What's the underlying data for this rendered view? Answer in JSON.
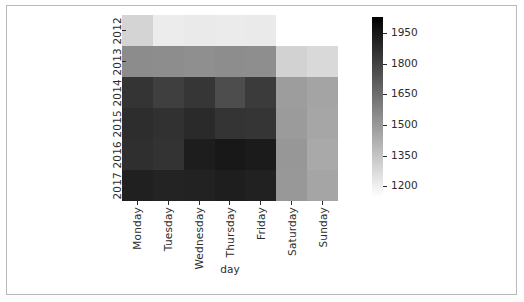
{
  "chart_data": {
    "type": "heatmap",
    "title": "",
    "xlabel": "day",
    "ylabel": "",
    "grid": false,
    "colormap": "gray_reversed",
    "x_categories": [
      "Monday",
      "Tuesday",
      "Wednesday",
      "Thursday",
      "Friday",
      "Saturday",
      "Sunday"
    ],
    "y_categories": [
      "2012",
      "2013",
      "2014",
      "2015",
      "2016",
      "2017"
    ],
    "colorbar": {
      "position": "right",
      "vmin": 1150,
      "vmax": 2030,
      "low_color": "#ffffff",
      "high_color": "#000000",
      "ticks": [
        1950,
        1800,
        1650,
        1500,
        1350,
        1200
      ],
      "tick_labels": [
        "1950",
        "1800",
        "1650",
        "1500",
        "1350",
        "1200"
      ]
    },
    "rows": [
      {
        "year": "2012",
        "values": [
          1290,
          1225,
          1235,
          1232,
          1238,
          null,
          null
        ]
      },
      {
        "year": "2013",
        "values": [
          1570,
          1565,
          1560,
          1568,
          1562,
          1292,
          1268
        ]
      },
      {
        "year": "2014",
        "values": [
          1905,
          1855,
          1900,
          1800,
          1870,
          1525,
          1500
        ]
      },
      {
        "year": "2015",
        "values": [
          1930,
          1915,
          1940,
          1905,
          1900,
          1530,
          1495
        ]
      },
      {
        "year": "2016",
        "values": [
          1920,
          1905,
          1990,
          2010,
          1995,
          1545,
          1485
        ]
      },
      {
        "year": "2017",
        "values": [
          1985,
          1975,
          1980,
          1990,
          1982,
          1540,
          1498
        ]
      }
    ],
    "cell_colors": [
      [
        "#d4d4d4",
        "#ececec",
        "#eaeaea",
        "#ebebeb",
        "#eaeaea",
        "#ffffff",
        "#ffffff"
      ],
      [
        "#8c8c8c",
        "#8d8d8d",
        "#8f8f8f",
        "#8d8d8d",
        "#8e8e8e",
        "#d2d2d2",
        "#d9d9d9"
      ],
      [
        "#343434",
        "#3f3f3f",
        "#363636",
        "#4d4d4d",
        "#3b3b3b",
        "#9d9d9d",
        "#a4a4a4"
      ],
      [
        "#2d2d2d",
        "#313131",
        "#2a2a2a",
        "#343434",
        "#353535",
        "#9b9b9b",
        "#a6a6a6"
      ],
      [
        "#2f2f2f",
        "#333333",
        "#1d1d1d",
        "#181818",
        "#1b1b1b",
        "#979797",
        "#a9a9a9"
      ],
      [
        "#202020",
        "#232323",
        "#222222",
        "#1e1e1e",
        "#212121",
        "#989898",
        "#a5a5a5"
      ]
    ]
  },
  "axes": {
    "x_title": "day",
    "x_tick_labels": [
      "Monday",
      "Tuesday",
      "Wednesday",
      "Thursday",
      "Friday",
      "Saturday",
      "Sunday"
    ],
    "y_tick_labels": [
      "2012",
      "2013",
      "2014",
      "2015",
      "2016",
      "2017"
    ]
  },
  "colorbar": {
    "tick_labels": [
      "1950",
      "1800",
      "1650",
      "1500",
      "1350",
      "1200"
    ]
  },
  "colors": {
    "axis_text": "#2b2b2b",
    "frame": "#b9b9b9",
    "background": "#ffffff"
  }
}
